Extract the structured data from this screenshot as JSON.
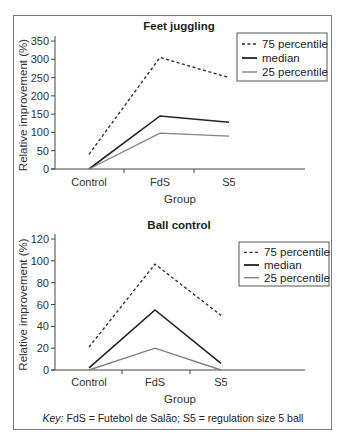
{
  "figure": {
    "key_prefix": "Key:",
    "key_text": " FdS = Futebol de Salão; S5 = regulation size 5 ball"
  },
  "legend": {
    "items": [
      {
        "label": "75 percentile",
        "style": "dashed",
        "color": "#333333"
      },
      {
        "label": "median",
        "style": "solid",
        "color": "#222222"
      },
      {
        "label": "25 percentile",
        "style": "solid",
        "color": "#808080"
      }
    ]
  },
  "chart_data": [
    {
      "type": "line",
      "title": "Feet juggling",
      "xlabel": "Group",
      "ylabel": "Relative improvement (%)",
      "categories": [
        "Control",
        "FdS",
        "S5"
      ],
      "ylim": [
        0,
        350
      ],
      "yticks": [
        0,
        50,
        100,
        150,
        200,
        250,
        300,
        350
      ],
      "grid": false,
      "legend_position": "upper right",
      "series": [
        {
          "name": "75 percentile",
          "values": [
            40,
            305,
            250
          ]
        },
        {
          "name": "median",
          "values": [
            0,
            145,
            128
          ]
        },
        {
          "name": "25 percentile",
          "values": [
            0,
            98,
            90
          ]
        }
      ]
    },
    {
      "type": "line",
      "title": "Ball control",
      "xlabel": "Group",
      "ylabel": "Relative improvement (%)",
      "categories": [
        "Control",
        "FdS",
        "S5"
      ],
      "ylim": [
        0,
        120
      ],
      "yticks": [
        0,
        20,
        40,
        60,
        80,
        100,
        120
      ],
      "grid": false,
      "legend_position": "upper right",
      "series": [
        {
          "name": "75 percentile",
          "values": [
            21,
            97,
            50
          ]
        },
        {
          "name": "median",
          "values": [
            2,
            55,
            6
          ]
        },
        {
          "name": "25 percentile",
          "values": [
            0,
            20,
            0
          ]
        }
      ]
    }
  ]
}
